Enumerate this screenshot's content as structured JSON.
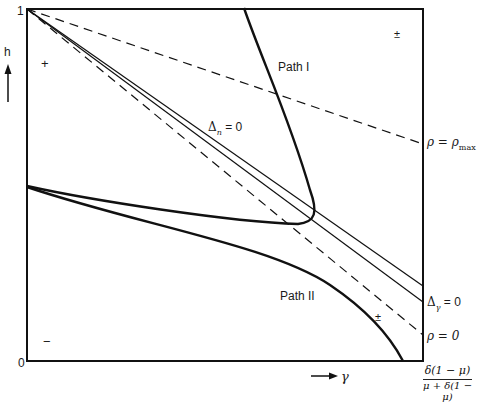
{
  "diagram": {
    "type": "phase-diagram",
    "axes": {
      "y_label": "h",
      "y_top_tick": "1",
      "origin_tick": "0",
      "x_label": "γ",
      "x_right_tick_numerator": "δ(1 − μ)",
      "x_right_tick_denominator": "μ + δ(1 − μ)"
    },
    "curves": [
      {
        "id": "rho-max",
        "label": "ρ = ρ",
        "label_sub": "max",
        "style": "dashed"
      },
      {
        "id": "delta-n",
        "label": "Δ",
        "label_sub": "n",
        "label_suffix": " = 0",
        "style": "solid-thin"
      },
      {
        "id": "delta-gamma",
        "label": "Δ",
        "label_sub": "γ",
        "label_suffix": " = 0",
        "style": "solid-thin"
      },
      {
        "id": "rho-zero",
        "label": "ρ = 0",
        "style": "dashed"
      },
      {
        "id": "path-1",
        "label": "Path I",
        "style": "solid-bold"
      },
      {
        "id": "path-2",
        "label": "Path II",
        "style": "solid-bold"
      }
    ],
    "region_signs": {
      "upper_left": "+",
      "upper_right": "±",
      "lower_left": "−",
      "lower_right": "±"
    }
  }
}
